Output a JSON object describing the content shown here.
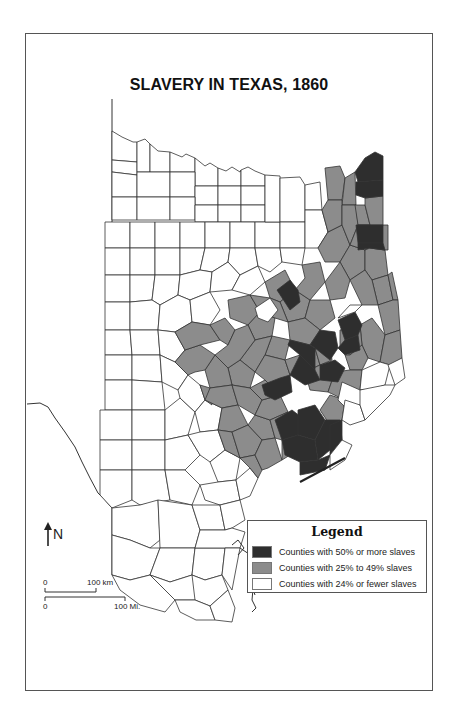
{
  "title": "SLAVERY IN TEXAS, 1860",
  "legend": {
    "title": "Legend",
    "items": [
      {
        "label": "Counties with 50% or more slaves",
        "color": "#2e2e2e"
      },
      {
        "label": "Counties with 25% to 49% slaves",
        "color": "#8c8c8c"
      },
      {
        "label": "Counties with 24% or fewer slaves",
        "color": "#ffffff"
      }
    ]
  },
  "north_arrow": {
    "label": "N"
  },
  "scale_bar": {
    "km": {
      "zero": "0",
      "end": "100 km"
    },
    "mi": {
      "zero": "0",
      "end": "100 Mi."
    }
  },
  "colors": {
    "high": "#2e2e2e",
    "mid": "#8c8c8c",
    "low": "#ffffff",
    "border": "#333333"
  }
}
